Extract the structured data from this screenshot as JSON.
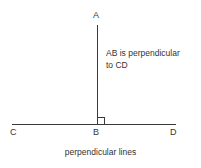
{
  "figure": {
    "caption": "perpendicular lines",
    "background_color": "#ffffff",
    "line_color": "#3a3a3a",
    "text_color": "#333333"
  },
  "points": {
    "a": {
      "label": "A",
      "x": 97,
      "y": 25
    },
    "b": {
      "label": "B",
      "x": 97,
      "y": 124
    },
    "c": {
      "label": "C",
      "x": 12,
      "y": 124
    },
    "d": {
      "label": "D",
      "x": 176,
      "y": 124
    }
  },
  "segments": {
    "ab": {
      "name": "AB",
      "x1": 97,
      "y1": 25,
      "x2": 97,
      "y2": 124
    },
    "cd": {
      "name": "CD",
      "x1": 12,
      "y1": 124,
      "x2": 176,
      "y2": 124
    }
  },
  "right_angle_marker": {
    "size": 7,
    "x": 97,
    "y": 124
  },
  "annotation": {
    "line1": "AB is perpendicular",
    "line2": "to CD"
  }
}
